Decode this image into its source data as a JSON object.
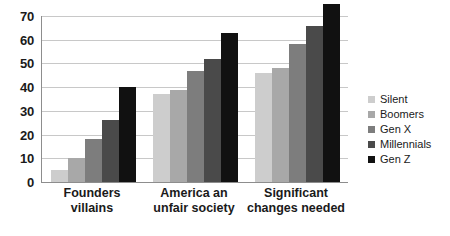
{
  "chart_data": {
    "type": "bar",
    "title": "",
    "subtitle": "",
    "xlabel": "",
    "ylabel": "",
    "ylim": [
      0,
      70
    ],
    "ytick_step": 10,
    "yticks": [
      0,
      10,
      20,
      30,
      40,
      50,
      60,
      70
    ],
    "ytick_labels": [
      "0",
      "10",
      "20",
      "30",
      "40",
      "50",
      "60",
      "70"
    ],
    "grid": true,
    "grid_axis": "y",
    "legend_position": "right",
    "categories": [
      "Founders villains",
      "America an unfair society",
      "Significant changes needed"
    ],
    "category_lines": [
      [
        "Founders villains"
      ],
      [
        "America an",
        "unfair society"
      ],
      [
        "Significant",
        "changes needed"
      ]
    ],
    "series": [
      {
        "name": "Silent",
        "color": "#cdcdcd",
        "values": [
          5,
          37,
          46
        ]
      },
      {
        "name": "Boomers",
        "color": "#a8a8a8",
        "values": [
          10,
          39,
          48
        ]
      },
      {
        "name": "Gen X",
        "color": "#7d7d7d",
        "values": [
          18,
          47,
          58
        ]
      },
      {
        "name": "Millennials",
        "color": "#4a4a4a",
        "values": [
          26,
          52,
          66
        ]
      },
      {
        "name": "Gen Z",
        "color": "#111111",
        "values": [
          40,
          63,
          75
        ]
      }
    ]
  },
  "axis": {
    "axis_line_color": "#8d8d8d",
    "gridline_color": "#c8c8c8"
  },
  "legend": {
    "items": [
      {
        "label": "Silent",
        "color": "#cdcdcd"
      },
      {
        "label": "Boomers",
        "color": "#a8a8a8"
      },
      {
        "label": "Gen X",
        "color": "#7d7d7d"
      },
      {
        "label": "Millennials",
        "color": "#4a4a4a"
      },
      {
        "label": "Gen Z",
        "color": "#111111"
      }
    ]
  }
}
